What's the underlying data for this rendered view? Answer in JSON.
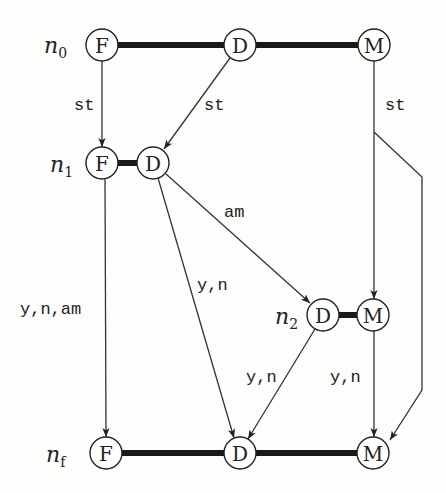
{
  "diagram": {
    "rows": [
      {
        "id": "n0",
        "label": "n",
        "sub": "0"
      },
      {
        "id": "n1",
        "label": "n",
        "sub": "1"
      },
      {
        "id": "n2",
        "label": "n",
        "sub": "2"
      },
      {
        "id": "nf",
        "label": "n",
        "sub": "f"
      }
    ],
    "nodes": {
      "n0_F": "F",
      "n0_D": "D",
      "n0_M": "M",
      "n1_F": "F",
      "n1_D": "D",
      "n2_D": "D",
      "n2_M": "M",
      "nf_F": "F",
      "nf_D": "D",
      "nf_M": "M"
    },
    "edges": [
      {
        "from": "n0_F",
        "to": "n1_F",
        "label": "st"
      },
      {
        "from": "n0_D",
        "to": "n1_D",
        "label": "st"
      },
      {
        "from": "n0_M",
        "to": "n2_M",
        "label": "st"
      },
      {
        "from": "n0_M",
        "to": "nf_M",
        "label": ""
      },
      {
        "from": "n1_D",
        "to": "n2_D",
        "label": "am"
      },
      {
        "from": "n1_F",
        "to": "nf_F",
        "label": "y,n,am"
      },
      {
        "from": "n1_D",
        "to": "nf_D",
        "label": "y,n"
      },
      {
        "from": "n2_D",
        "to": "nf_D",
        "label": "y,n"
      },
      {
        "from": "n2_M",
        "to": "nf_M",
        "label": "y,n"
      }
    ],
    "edge_labels": {
      "st_F": "st",
      "st_D": "st",
      "st_M": "st",
      "am": "am",
      "ynam": "y,n,am",
      "yn_D1": "y,n",
      "yn_D2": "y,n",
      "yn_M": "y,n"
    }
  }
}
